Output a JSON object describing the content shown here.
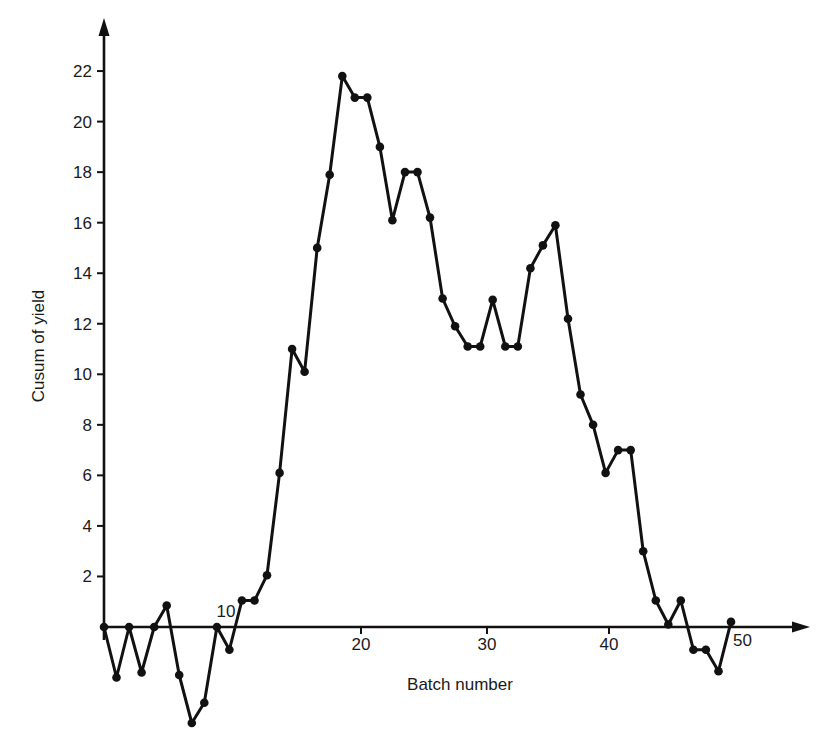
{
  "chart_data": {
    "type": "line",
    "title": "",
    "xlabel": "Batch number",
    "ylabel": "Cusum of yield",
    "x": [
      0,
      1,
      2,
      3,
      4,
      5,
      6,
      7,
      8,
      9,
      10,
      11,
      12,
      13,
      14,
      15,
      16,
      17,
      18,
      19,
      20,
      21,
      22,
      23,
      24,
      25,
      26,
      27,
      28,
      29,
      30,
      31,
      32,
      33,
      34,
      35,
      36,
      37,
      38,
      39,
      40,
      41,
      42,
      43,
      44,
      45,
      46,
      47,
      48,
      49,
      50
    ],
    "series": [
      {
        "name": "Cusum of yield",
        "values": [
          0,
          -2.0,
          0,
          -1.8,
          0,
          0.85,
          -1.9,
          -3.8,
          -3.0,
          0,
          -0.9,
          1.05,
          1.05,
          2.05,
          6.1,
          11.0,
          10.1,
          15.0,
          17.9,
          21.8,
          20.95,
          20.95,
          19.0,
          16.1,
          18.0,
          18.0,
          16.2,
          13.0,
          11.9,
          11.1,
          11.1,
          12.95,
          11.1,
          11.1,
          14.2,
          15.1,
          15.9,
          12.2,
          9.2,
          8.0,
          6.1,
          7.0,
          7.0,
          3.0,
          1.05,
          0.1,
          1.05,
          -0.9,
          -0.9,
          -1.75,
          0.2
        ],
        "color": "#111111",
        "markers": true
      }
    ],
    "x_ticks": [
      {
        "value": 10,
        "label": "10"
      },
      {
        "value": 20,
        "label": "20"
      },
      {
        "value": 30,
        "label": "30"
      },
      {
        "value": 40,
        "label": "40"
      },
      {
        "value": 50,
        "label": "50"
      }
    ],
    "y_ticks": [
      {
        "value": 2,
        "label": "2"
      },
      {
        "value": 4,
        "label": "4"
      },
      {
        "value": 6,
        "label": "6"
      },
      {
        "value": 8,
        "label": "8"
      },
      {
        "value": 10,
        "label": "10"
      },
      {
        "value": 12,
        "label": "12"
      },
      {
        "value": 14,
        "label": "14"
      },
      {
        "value": 16,
        "label": "16"
      },
      {
        "value": 18,
        "label": "18"
      },
      {
        "value": 20,
        "label": "20"
      },
      {
        "value": 22,
        "label": "22"
      }
    ],
    "xlim": [
      0,
      56
    ],
    "ylim": [
      -4,
      24
    ],
    "grid": false,
    "legend": "none"
  }
}
